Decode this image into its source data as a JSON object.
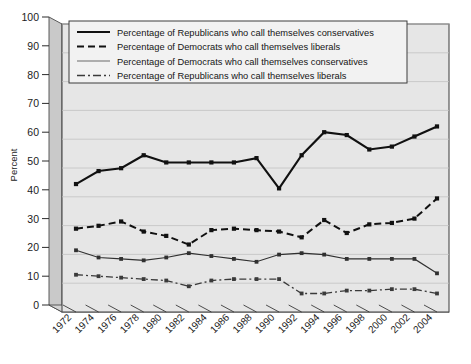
{
  "chart_data": {
    "type": "line",
    "title": "",
    "xlabel": "",
    "ylabel": "Percent",
    "ylim": [
      0,
      100
    ],
    "ytick_step": 10,
    "grid": true,
    "legend_position": "top-center-inside",
    "categories": [
      "1972",
      "1974",
      "1976",
      "1978",
      "1980",
      "1982",
      "1984",
      "1986",
      "1988",
      "1990",
      "1992",
      "1994",
      "1996",
      "1998",
      "2000",
      "2002",
      "2004"
    ],
    "yticks": [
      "0",
      "10",
      "20",
      "30",
      "40",
      "50",
      "60",
      "70",
      "80",
      "90",
      "100"
    ],
    "series": [
      {
        "name": "Percentage of Republicans who call themselves conservatives",
        "style": "solid-thick",
        "color": "#111111",
        "values": [
          42,
          46.5,
          47.5,
          52,
          49.5,
          49.5,
          49.5,
          49.5,
          51,
          40.5,
          52,
          60,
          59,
          54,
          55,
          58.5,
          62
        ]
      },
      {
        "name": "Percentage of Democrats who call themselves liberals",
        "style": "dashed",
        "color": "#111111",
        "values": [
          26.5,
          27.5,
          29,
          25.5,
          24,
          21,
          26,
          26.5,
          26,
          25.5,
          23.5,
          29.5,
          25,
          28,
          28.5,
          30,
          37
        ]
      },
      {
        "name": "Percentage of Democrats who call themselves conservatives",
        "style": "solid-thin",
        "color": "#303030",
        "values": [
          19,
          16.5,
          16,
          15.5,
          16.5,
          18,
          17,
          16,
          15,
          17.5,
          18,
          17.5,
          16,
          16,
          16,
          16,
          11
        ]
      },
      {
        "name": "Percentage of Republicans who call themselves liberals",
        "style": "dash-dot",
        "color": "#3a3a3a",
        "values": [
          10.5,
          10,
          9.5,
          9,
          8.5,
          6.5,
          8.5,
          9,
          9,
          9,
          4,
          4,
          5,
          5,
          5.5,
          5.5,
          4
        ]
      }
    ]
  },
  "colors": {
    "plot_background": "#e6e6e6",
    "wall_shade": "#c9c9c9",
    "wall_shade_dark": "#b3b3b3",
    "gridline": "#c2c2c2",
    "frame": "#4a4a4a",
    "legend_background": "#f2f2f2",
    "page_background": "#ffffff"
  }
}
